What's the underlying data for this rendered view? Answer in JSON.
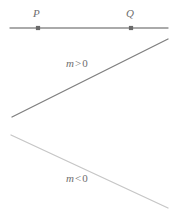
{
  "figure": {
    "width": 178,
    "height": 221,
    "background": "#ffffff"
  },
  "labels": {
    "point_p": "P",
    "point_q": "Q",
    "positive_slope": {
      "variable": "m",
      "operator": ">",
      "value": "0",
      "full": "m > 0"
    },
    "negative_slope": {
      "variable": "m",
      "operator": "<",
      "value": "0",
      "full": "m < 0"
    }
  },
  "chart_data": {
    "type": "line",
    "title": "",
    "xlabel": "",
    "ylabel": "",
    "grid": false,
    "legend": "none",
    "series": [
      {
        "name": "horizontal-line-through-P-and-Q",
        "slope": 0,
        "color": "#8f8f8f",
        "stroke_width": 1.3,
        "x": [
          10,
          168
        ],
        "y": [
          28,
          28
        ],
        "points": [
          {
            "label": "P",
            "x": 38,
            "y": 28
          },
          {
            "label": "Q",
            "x": 131,
            "y": 28
          }
        ]
      },
      {
        "name": "positive-slope-line",
        "slope": "positive",
        "annotation": "m > 0",
        "color": "#7f7f7f",
        "stroke_width": 1.3,
        "x": [
          12,
          168
        ],
        "y": [
          117,
          39
        ]
      },
      {
        "name": "negative-slope-line",
        "slope": "negative",
        "annotation": "m < 0",
        "color": "#c6c6c6",
        "stroke_width": 1.3,
        "x": [
          11,
          168
        ],
        "y": [
          135,
          208
        ]
      }
    ],
    "xlim": [
      0,
      178
    ],
    "ylim": [
      0,
      221
    ]
  },
  "colors": {
    "line_horizontal": "#8f8f8f",
    "line_positive": "#7f7f7f",
    "line_negative": "#c6c6c6",
    "point_marker": "#6a6a6a",
    "text": "#6e6e6e",
    "background": "#ffffff"
  }
}
